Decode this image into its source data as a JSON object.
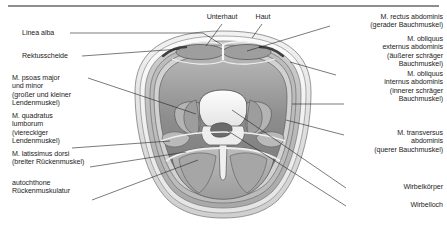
{
  "figure": {
    "language": "de",
    "top_rule": true
  },
  "labels_left": [
    {
      "id": "linea-alba",
      "text": "Linea alba"
    },
    {
      "id": "rektusscheide",
      "text": "Rektusscheide"
    },
    {
      "id": "m-psoas",
      "text": "M. psoas major\nund minor\n(großer und kleiner\nLendenmuskel)"
    },
    {
      "id": "m-quadratus-lumborum",
      "text": "M. quadratus\nlumborum\n(viereckiger\nLendenmuskel)"
    },
    {
      "id": "m-latissimus-dorsi",
      "text": "M. latissimus dorsi\n(breiter Rückenmuskel)"
    },
    {
      "id": "autochthone-rueckenmuskulatur",
      "text": "autochthone\nRückenmuskulatur"
    }
  ],
  "labels_top": [
    {
      "id": "unterhaut",
      "text": "Unterhaut"
    },
    {
      "id": "haut",
      "text": "Haut"
    }
  ],
  "labels_right": [
    {
      "id": "m-rectus-abdominis",
      "text": "M. rectus abdominis\n(gerader Bauchmuskel)"
    },
    {
      "id": "m-obliquus-externus",
      "text": "M. obliquus\nexternus abdominis\n(äußerer schräger\nBauchmuskel)"
    },
    {
      "id": "m-obliquus-internus",
      "text": "M. obliquus\ninternus abdominis\n(innerer schräger\nBauchmuskel)"
    },
    {
      "id": "m-transversus-abdominis",
      "text": "M. transversus\nabdominis\n(querer Bauchmuskel)"
    },
    {
      "id": "wirbelkoerper",
      "text": "Wirbelkörper"
    },
    {
      "id": "wirbelloch",
      "text": "Wirbelloch"
    }
  ],
  "colors": {
    "rule": "#8e8e8e",
    "leader_line": "#222222",
    "text": "#1d1d1d",
    "skin_outer": "#d9d9d9",
    "subcutis": "#ebebeb",
    "muscle_light": "#c3c3c3",
    "muscle_mid": "#9a9a9a",
    "muscle_dark": "#6f6f6f",
    "cavity": "#8a8a8a",
    "bone": "#efefef",
    "bone_edge": "#6a6a6a",
    "canal": "#6b6b6b"
  }
}
